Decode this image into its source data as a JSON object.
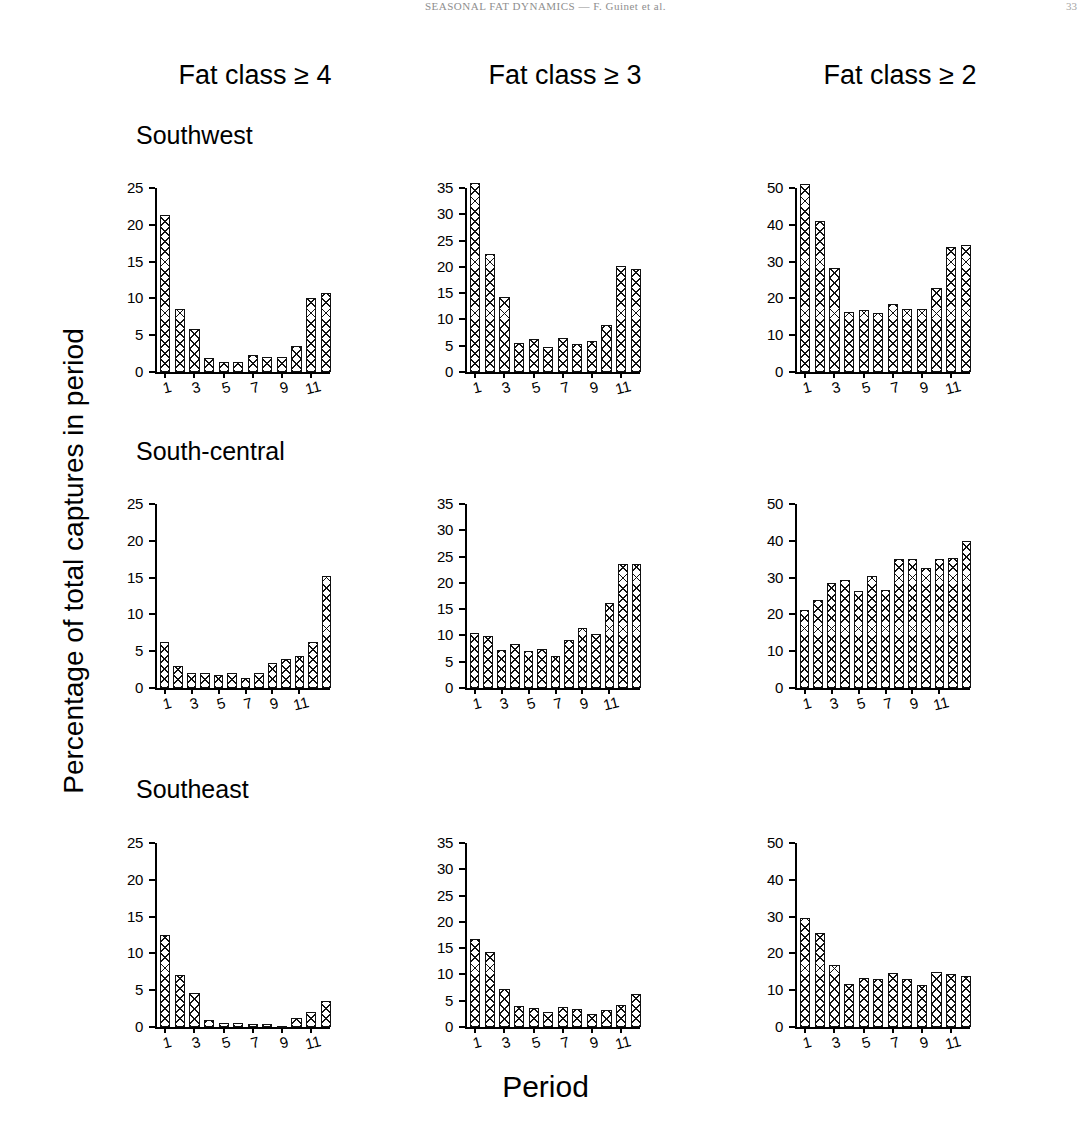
{
  "header": {
    "center": "SEASONAL FAT DYNAMICS — F. Guinet et al.",
    "right": "33"
  },
  "figure": {
    "column_titles": [
      "Fat class ≥ 4",
      "Fat class ≥ 3",
      "Fat class ≥ 2"
    ],
    "row_titles": [
      "Southwest",
      "South-central",
      "Southeast"
    ],
    "ylabel": "Percentage of total captures in period",
    "xlabel": "Period"
  },
  "chart_data": [
    {
      "type": "bar",
      "title": "Fat class ≥ 4 — Southwest",
      "row": "Southwest",
      "column": "Fat class ≥ 4",
      "xlabel": "Period",
      "ylabel": "Percentage of total captures in period",
      "categories": [
        1,
        2,
        3,
        4,
        5,
        6,
        7,
        8,
        9,
        10,
        11,
        12
      ],
      "values": [
        21.3,
        8.6,
        5.9,
        1.9,
        1.4,
        1.4,
        2.3,
        2.1,
        2.1,
        3.6,
        10.0,
        10.8
      ],
      "ylim": [
        0,
        25
      ],
      "yticks": [
        0,
        5,
        10,
        15,
        20,
        25
      ],
      "xticks": [
        1,
        3,
        5,
        7,
        9,
        11
      ],
      "grid": false
    },
    {
      "type": "bar",
      "title": "Fat class ≥ 3 — Southwest",
      "row": "Southwest",
      "column": "Fat class ≥ 3",
      "xlabel": "Period",
      "ylabel": "Percentage of total captures in period",
      "categories": [
        1,
        2,
        3,
        4,
        5,
        6,
        7,
        8,
        9,
        10,
        11,
        12
      ],
      "values": [
        36.0,
        22.5,
        14.3,
        5.5,
        6.2,
        4.8,
        6.5,
        5.3,
        5.9,
        9.0,
        20.2,
        19.6
      ],
      "ylim": [
        0,
        35
      ],
      "yticks": [
        0,
        5,
        10,
        15,
        20,
        25,
        30,
        35
      ],
      "xticks": [
        1,
        3,
        5,
        7,
        9,
        11
      ],
      "grid": false
    },
    {
      "type": "bar",
      "title": "Fat class ≥ 2 — Southwest",
      "row": "Southwest",
      "column": "Fat class ≥ 2",
      "xlabel": "Period",
      "ylabel": "Percentage of total captures in period",
      "categories": [
        1,
        2,
        3,
        4,
        5,
        6,
        7,
        8,
        9,
        10,
        11,
        12
      ],
      "values": [
        51.0,
        41.0,
        28.2,
        16.3,
        16.8,
        16.0,
        18.5,
        17.2,
        17.2,
        22.8,
        34.0,
        34.5
      ],
      "ylim": [
        0,
        50
      ],
      "yticks": [
        0,
        10,
        20,
        30,
        40,
        50
      ],
      "xticks": [
        1,
        3,
        5,
        7,
        9,
        11
      ],
      "grid": false
    },
    {
      "type": "bar",
      "title": "Fat class ≥ 4 — South-central",
      "row": "South-central",
      "column": "Fat class ≥ 4",
      "xlabel": "Period",
      "ylabel": "Percentage of total captures in period",
      "categories": [
        1,
        2,
        3,
        4,
        5,
        6,
        7,
        8,
        9,
        10,
        11,
        12,
        13
      ],
      "values": [
        6.2,
        3.0,
        2.0,
        2.0,
        1.8,
        2.1,
        1.3,
        2.1,
        3.4,
        4.0,
        4.3,
        6.2,
        15.2
      ],
      "ylim": [
        0,
        25
      ],
      "yticks": [
        0,
        5,
        10,
        15,
        20,
        25
      ],
      "xticks": [
        1,
        3,
        5,
        7,
        9,
        11
      ],
      "grid": false
    },
    {
      "type": "bar",
      "title": "Fat class ≥ 3 — South-central",
      "row": "South-central",
      "column": "Fat class ≥ 3",
      "xlabel": "Period",
      "ylabel": "Percentage of total captures in period",
      "categories": [
        1,
        2,
        3,
        4,
        5,
        6,
        7,
        8,
        9,
        10,
        11,
        12,
        13
      ],
      "values": [
        10.5,
        9.8,
        7.3,
        8.3,
        7.0,
        7.4,
        6.0,
        9.2,
        11.5,
        10.3,
        16.2,
        23.5,
        23.5
      ],
      "ylim": [
        0,
        35
      ],
      "yticks": [
        0,
        5,
        10,
        15,
        20,
        25,
        30,
        35
      ],
      "xticks": [
        1,
        3,
        5,
        7,
        9,
        11
      ],
      "grid": false
    },
    {
      "type": "bar",
      "title": "Fat class ≥ 2 — South-central",
      "row": "South-central",
      "column": "Fat class ≥ 2",
      "xlabel": "Period",
      "ylabel": "Percentage of total captures in period",
      "categories": [
        1,
        2,
        3,
        4,
        5,
        6,
        7,
        8,
        9,
        10,
        11,
        12,
        13
      ],
      "values": [
        21.3,
        24.0,
        28.5,
        29.3,
        26.3,
        30.5,
        26.5,
        35.0,
        35.0,
        32.5,
        35.0,
        35.2,
        40.0
      ],
      "ylim": [
        0,
        50
      ],
      "yticks": [
        0,
        10,
        20,
        30,
        40,
        50
      ],
      "xticks": [
        1,
        3,
        5,
        7,
        9,
        11
      ],
      "grid": false
    },
    {
      "type": "bar",
      "title": "Fat class ≥ 4 — Southeast",
      "row": "Southeast",
      "column": "Fat class ≥ 4",
      "xlabel": "Period",
      "ylabel": "Percentage of total captures in period",
      "categories": [
        1,
        2,
        3,
        4,
        5,
        6,
        7,
        8,
        9,
        10,
        11,
        12
      ],
      "values": [
        12.5,
        7.0,
        4.6,
        0.9,
        0.55,
        0.6,
        0.45,
        0.4,
        0.2,
        1.2,
        2.0,
        3.6
      ],
      "ylim": [
        0,
        25
      ],
      "yticks": [
        0,
        5,
        10,
        15,
        20,
        25
      ],
      "xticks": [
        1,
        3,
        5,
        7,
        9,
        11
      ],
      "grid": false
    },
    {
      "type": "bar",
      "title": "Fat class ≥ 3 — Southeast",
      "row": "Southeast",
      "column": "Fat class ≥ 3",
      "xlabel": "Period",
      "ylabel": "Percentage of total captures in period",
      "categories": [
        1,
        2,
        3,
        4,
        5,
        6,
        7,
        8,
        9,
        10,
        11,
        12
      ],
      "values": [
        16.8,
        14.2,
        7.2,
        3.9,
        3.7,
        2.9,
        3.8,
        3.4,
        2.5,
        3.2,
        4.2,
        6.2
      ],
      "ylim": [
        0,
        35
      ],
      "yticks": [
        0,
        5,
        10,
        15,
        20,
        25,
        30,
        35
      ],
      "xticks": [
        1,
        3,
        5,
        7,
        9,
        11
      ],
      "grid": false
    },
    {
      "type": "bar",
      "title": "Fat class ≥ 2 — Southeast",
      "row": "Southeast",
      "column": "Fat class ≥ 2",
      "xlabel": "Period",
      "ylabel": "Percentage of total captures in period",
      "categories": [
        1,
        2,
        3,
        4,
        5,
        6,
        7,
        8,
        9,
        10,
        11,
        12
      ],
      "values": [
        29.5,
        25.5,
        16.8,
        11.8,
        13.2,
        13.1,
        14.8,
        13.1,
        11.3,
        15.0,
        14.5,
        13.8
      ],
      "ylim": [
        0,
        50
      ],
      "yticks": [
        0,
        10,
        20,
        30,
        40,
        50
      ],
      "xticks": [
        1,
        3,
        5,
        7,
        9,
        11
      ],
      "grid": false
    }
  ]
}
